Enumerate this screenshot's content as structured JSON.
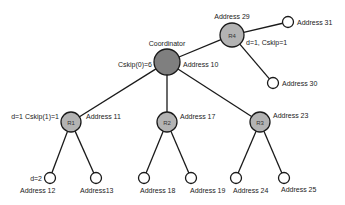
{
  "diagram": {
    "type": "tree",
    "colors": {
      "coordinator_fill": "#7f7f7f",
      "router_fill": "#b3b3b3",
      "end_device_fill": "#ffffff",
      "stroke": "#1a1a1a"
    },
    "nodes": {
      "coordinator": {
        "name": "Coordinator",
        "address": "Address 10",
        "annotation": "Cskip(0)=6"
      },
      "r4": {
        "label": "R4",
        "address": "Address 29",
        "annotation": "d=1, Cskip=1"
      },
      "a31": {
        "address": "Address 31"
      },
      "a30": {
        "address": "Address 30"
      },
      "r1": {
        "label": "R1",
        "address": "Address 11",
        "annotation": "d=1 Cskip(1)=1"
      },
      "r2": {
        "label": "R2",
        "address": "Address 17"
      },
      "r3": {
        "label": "R3",
        "address": "Address 23"
      },
      "a12": {
        "address": "Address  12",
        "annotation": "d=2"
      },
      "a13": {
        "address": "Address13"
      },
      "a18": {
        "address": "Address 18"
      },
      "a19": {
        "address": "Address 19"
      },
      "a24": {
        "address": "Address 24"
      },
      "a25": {
        "address": "Address 25"
      }
    },
    "edges": [
      [
        "coordinator",
        "r4"
      ],
      [
        "r4",
        "a31"
      ],
      [
        "r4",
        "a30"
      ],
      [
        "coordinator",
        "r1"
      ],
      [
        "coordinator",
        "r2"
      ],
      [
        "coordinator",
        "r3"
      ],
      [
        "r1",
        "a12"
      ],
      [
        "r1",
        "a13"
      ],
      [
        "r2",
        "a18"
      ],
      [
        "r2",
        "a19"
      ],
      [
        "r3",
        "a24"
      ],
      [
        "r3",
        "a25"
      ]
    ]
  }
}
